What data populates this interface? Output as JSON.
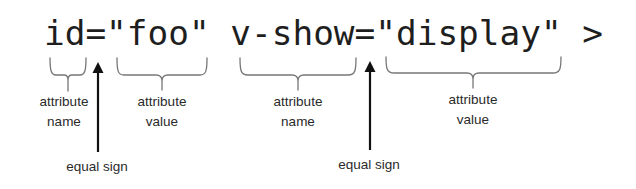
{
  "code_line": {
    "text": "id=\"foo\" v-show=\"display\" >",
    "color": "#1e1e1e"
  },
  "annotations": {
    "attr1_name": {
      "line1": "attribute",
      "line2": "name"
    },
    "attr1_value": {
      "line1": "attribute",
      "line2": "value"
    },
    "equal1": {
      "label": "equal sign"
    },
    "attr2_name": {
      "line1": "attribute",
      "line2": "name"
    },
    "equal2": {
      "label": "equal sign"
    },
    "attr2_value": {
      "line1": "attribute",
      "line2": "value"
    }
  },
  "colors": {
    "bracket": "#777777",
    "arrow": "#111111",
    "label": "#2a2a2a"
  }
}
